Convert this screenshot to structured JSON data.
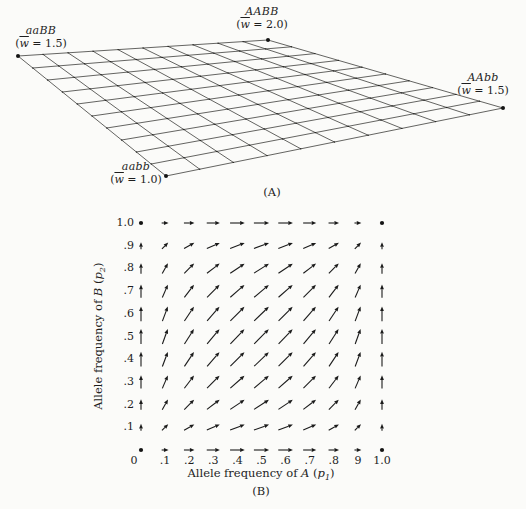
{
  "figure": {
    "panelA": {
      "label": "(A)",
      "corners": [
        {
          "genotype": "aaBB",
          "fit_pre": "(",
          "fit_w": "w",
          "fit_post": " = 1.5)"
        },
        {
          "genotype": "AABB",
          "fit_pre": "(",
          "fit_w": "w",
          "fit_post": " = 2.0)"
        },
        {
          "genotype": "AAbb",
          "fit_pre": "(",
          "fit_w": "w",
          "fit_post": " = 1.5)"
        },
        {
          "genotype": "aabb",
          "fit_pre": "(",
          "fit_w": "w",
          "fit_post": " = 1.0)"
        }
      ]
    },
    "panelB": {
      "label": "(B)",
      "x_axis": {
        "prefix": "Allele frequency of ",
        "gene": "A",
        "open": " (",
        "symbol": "p",
        "subscript": "1",
        "close": ")"
      },
      "y_axis": {
        "prefix": "Allele frequency of ",
        "gene": "B",
        "open": " (",
        "symbol": "p",
        "subscript": "2",
        "close": ")"
      }
    }
  },
  "chart_data": [
    {
      "id": "A",
      "type": "surface",
      "description": "Tilted planar adaptive landscape (mean fitness surface) drawn as a 10x10 quadrilateral mesh over allele-frequency space",
      "grid_divisions": 10,
      "corners": [
        {
          "genotype": "aaBB",
          "p1": 0,
          "p2": 1,
          "mean_fitness": 1.5
        },
        {
          "genotype": "AABB",
          "p1": 1,
          "p2": 1,
          "mean_fitness": 2.0
        },
        {
          "genotype": "AAbb",
          "p1": 1,
          "p2": 0,
          "mean_fitness": 1.5
        },
        {
          "genotype": "aabb",
          "p1": 0,
          "p2": 0,
          "mean_fitness": 1.0
        }
      ]
    },
    {
      "id": "B",
      "type": "vector-field",
      "description": "Selection trajectories: arrow at (p1,p2) has components (p1(1-p1), p2(1-p2)); corners are equilibria shown as dots",
      "x_values": [
        0,
        0.1,
        0.2,
        0.3,
        0.4,
        0.5,
        0.6,
        0.7,
        0.8,
        0.9,
        1.0
      ],
      "y_values": [
        0,
        0.1,
        0.2,
        0.3,
        0.4,
        0.5,
        0.6,
        0.7,
        0.8,
        0.9,
        1.0
      ],
      "dx_by_p1": [
        0,
        0.09,
        0.16,
        0.21,
        0.24,
        0.25,
        0.24,
        0.21,
        0.16,
        0.09,
        0
      ],
      "dy_by_p2": [
        0,
        0.09,
        0.16,
        0.21,
        0.24,
        0.25,
        0.24,
        0.21,
        0.16,
        0.09,
        0
      ],
      "x_tick_labels": [
        "0",
        ".1",
        ".2",
        ".3",
        ".4",
        ".5",
        ".6",
        ".7",
        ".8",
        "9",
        "1.0"
      ],
      "y_tick_labels": [
        "0",
        ".1",
        ".2",
        ".3",
        ".4",
        ".5",
        ".6",
        ".7",
        ".8",
        ".9",
        "1.0"
      ],
      "xlabel": "Allele frequency of A (p1)",
      "ylabel": "Allele frequency of B (p2)",
      "equilibrium_points": [
        [
          0,
          0
        ],
        [
          0,
          1
        ],
        [
          1,
          0
        ],
        [
          1,
          1
        ]
      ],
      "xlim": [
        0,
        1
      ],
      "ylim": [
        0,
        1
      ],
      "grid": false,
      "legend": false
    }
  ]
}
